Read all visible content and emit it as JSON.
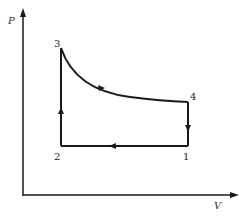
{
  "diagram": {
    "type": "pv-cycle",
    "axes": {
      "y_label": "P",
      "x_label": "V"
    },
    "points": [
      {
        "id": "1",
        "label": "1"
      },
      {
        "id": "2",
        "label": "2"
      },
      {
        "id": "3",
        "label": "3"
      },
      {
        "id": "4",
        "label": "4"
      }
    ],
    "paths": [
      {
        "from": "1",
        "to": "2",
        "kind": "isobaric",
        "direction": "left"
      },
      {
        "from": "2",
        "to": "3",
        "kind": "isochoric",
        "direction": "up"
      },
      {
        "from": "3",
        "to": "4",
        "kind": "expansion-curve",
        "direction": "right-down"
      },
      {
        "from": "4",
        "to": "1",
        "kind": "isochoric",
        "direction": "down"
      }
    ],
    "colors": {
      "line": "#1a1a1a",
      "background": "#ffffff"
    }
  }
}
